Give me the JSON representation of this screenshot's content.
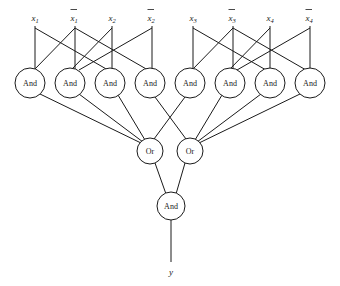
{
  "diagram": {
    "background_color": "#ffffff",
    "line_color": "#1a1a1a",
    "inputs": [
      {
        "id": "x1",
        "base": "x",
        "sub": "1",
        "negated": false,
        "label": "x1",
        "x": 35,
        "y": 18,
        "wire_x": 35,
        "wire_top": 24,
        "wire_bottom": 66
      },
      {
        "id": "nx1",
        "base": "x",
        "sub": "1",
        "negated": true,
        "label": "x̄1",
        "x": 75,
        "y": 18,
        "wire_x": 75,
        "wire_top": 24,
        "wire_bottom": 66
      },
      {
        "id": "x2",
        "base": "x",
        "sub": "2",
        "negated": false,
        "label": "x2",
        "x": 112,
        "y": 18,
        "wire_x": 112,
        "wire_top": 24,
        "wire_bottom": 66
      },
      {
        "id": "nx2",
        "base": "x",
        "sub": "2",
        "negated": true,
        "label": "x̄2",
        "x": 152,
        "y": 18,
        "wire_x": 152,
        "wire_top": 24,
        "wire_bottom": 66
      },
      {
        "id": "x3",
        "base": "x",
        "sub": "3",
        "negated": false,
        "label": "x3",
        "x": 193,
        "y": 18,
        "wire_x": 193,
        "wire_top": 24,
        "wire_bottom": 66
      },
      {
        "id": "nx3",
        "base": "x",
        "sub": "3",
        "negated": true,
        "label": "x̄3",
        "x": 233,
        "y": 18,
        "wire_x": 233,
        "wire_top": 24,
        "wire_bottom": 66
      },
      {
        "id": "x4",
        "base": "x",
        "sub": "4",
        "negated": false,
        "label": "x4",
        "x": 270,
        "y": 18,
        "wire_x": 270,
        "wire_top": 24,
        "wire_bottom": 66
      },
      {
        "id": "nx4",
        "base": "x",
        "sub": "4",
        "negated": true,
        "label": "x̄4",
        "x": 310,
        "y": 18,
        "wire_x": 310,
        "wire_top": 24,
        "wire_bottom": 66
      }
    ],
    "and_gates_row1": [
      {
        "id": "and1",
        "label": "And",
        "cx": 30,
        "cy": 83,
        "r": 15
      },
      {
        "id": "and2",
        "label": "And",
        "cx": 70,
        "cy": 83,
        "r": 15
      },
      {
        "id": "and3",
        "label": "And",
        "cx": 110,
        "cy": 83,
        "r": 15
      },
      {
        "id": "and4",
        "label": "And",
        "cx": 150,
        "cy": 83,
        "r": 15
      },
      {
        "id": "and5",
        "label": "And",
        "cx": 190,
        "cy": 83,
        "r": 15
      },
      {
        "id": "and6",
        "label": "And",
        "cx": 230,
        "cy": 83,
        "r": 15
      },
      {
        "id": "and7",
        "label": "And",
        "cx": 270,
        "cy": 83,
        "r": 15
      },
      {
        "id": "and8",
        "label": "And",
        "cx": 310,
        "cy": 83,
        "r": 15
      }
    ],
    "or_gates": [
      {
        "id": "or1",
        "label": "Or",
        "cx": 150,
        "cy": 151,
        "r": 13
      },
      {
        "id": "or2",
        "label": "Or",
        "cx": 190,
        "cy": 151,
        "r": 13
      }
    ],
    "output_and_gate": {
      "id": "and-out",
      "label": "And",
      "cx": 171,
      "cy": 206,
      "r": 14
    },
    "output": {
      "id": "y",
      "label": "y",
      "x": 171,
      "y": 272,
      "wire_top": 220,
      "wire_bottom": 262
    },
    "input_to_and_edges": [
      {
        "from": "x1",
        "to": "and1"
      },
      {
        "from": "x1",
        "to": "and3"
      },
      {
        "from": "nx1",
        "to": "and2"
      },
      {
        "from": "nx1",
        "to": "and4"
      },
      {
        "from": "x2",
        "to": "and3"
      },
      {
        "from": "x2",
        "to": "and2"
      },
      {
        "from": "nx2",
        "to": "and4"
      },
      {
        "from": "nx2",
        "to": "and1"
      },
      {
        "from": "x3",
        "to": "and5"
      },
      {
        "from": "x3",
        "to": "and7"
      },
      {
        "from": "nx3",
        "to": "and6"
      },
      {
        "from": "nx3",
        "to": "and8"
      },
      {
        "from": "x4",
        "to": "and7"
      },
      {
        "from": "x4",
        "to": "and6"
      },
      {
        "from": "nx4",
        "to": "and8"
      },
      {
        "from": "nx4",
        "to": "and5"
      }
    ],
    "and_to_or_edges": [
      {
        "from": "and1",
        "to": "or1"
      },
      {
        "from": "and2",
        "to": "or1"
      },
      {
        "from": "and3",
        "to": "or1"
      },
      {
        "from": "and4",
        "to": "or1"
      },
      {
        "from": "and5",
        "to": "or2"
      },
      {
        "from": "and6",
        "to": "or2"
      },
      {
        "from": "and7",
        "to": "or2"
      },
      {
        "from": "and8",
        "to": "or2"
      }
    ],
    "or_to_and_edges": [
      {
        "from": "or1",
        "to": "and-out"
      },
      {
        "from": "or2",
        "to": "and-out"
      }
    ]
  }
}
